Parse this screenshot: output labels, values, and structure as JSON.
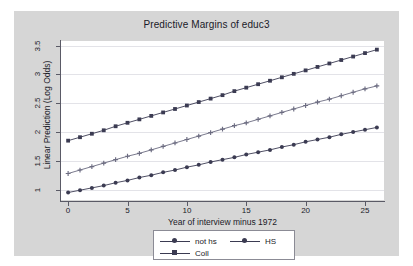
{
  "chart_data": {
    "type": "line",
    "title": "Predictive Margins of educ3",
    "xlabel": "Year of interview minus 1972",
    "ylabel": "Linear Prediction (Log Odds)",
    "xlim": [
      -0.6,
      26.6
    ],
    "ylim": [
      0.82,
      3.58
    ],
    "xticks": [
      0,
      5,
      10,
      15,
      20,
      25
    ],
    "yticks": [
      1,
      1.5,
      2,
      2.5,
      3,
      3.5
    ],
    "xtick_labels": [
      "0",
      "5",
      "10",
      "15",
      "20",
      "25"
    ],
    "ytick_labels": [
      "1",
      "1.5",
      "2",
      "2.5",
      "3",
      "3.5"
    ],
    "grid": "horizontal",
    "legend_position": "below",
    "x": [
      0,
      1,
      2,
      3,
      4,
      5,
      6,
      7,
      8,
      9,
      10,
      11,
      12,
      13,
      14,
      15,
      16,
      17,
      18,
      19,
      20,
      21,
      22,
      23,
      24,
      25,
      26
    ],
    "series": [
      {
        "name": "not hs",
        "marker": "circle",
        "color": "#3b3b52",
        "values": [
          0.95,
          0.99,
          1.03,
          1.07,
          1.12,
          1.16,
          1.21,
          1.25,
          1.3,
          1.34,
          1.39,
          1.43,
          1.48,
          1.52,
          1.56,
          1.61,
          1.65,
          1.69,
          1.74,
          1.78,
          1.83,
          1.87,
          1.91,
          1.96,
          2.0,
          2.04,
          2.08
        ]
      },
      {
        "name": "HS",
        "marker": "plus",
        "color": "#6b6b80",
        "values": [
          1.28,
          1.34,
          1.4,
          1.46,
          1.52,
          1.58,
          1.63,
          1.69,
          1.75,
          1.81,
          1.87,
          1.93,
          1.99,
          2.05,
          2.11,
          2.16,
          2.22,
          2.28,
          2.34,
          2.4,
          2.46,
          2.52,
          2.57,
          2.63,
          2.69,
          2.75,
          2.8
        ]
      },
      {
        "name": "Coll",
        "marker": "square",
        "color": "#3b3b52",
        "values": [
          1.85,
          1.91,
          1.97,
          2.03,
          2.1,
          2.16,
          2.22,
          2.28,
          2.34,
          2.4,
          2.46,
          2.52,
          2.58,
          2.64,
          2.71,
          2.77,
          2.83,
          2.89,
          2.95,
          3.01,
          3.07,
          3.13,
          3.19,
          3.25,
          3.31,
          3.37,
          3.43
        ]
      }
    ]
  },
  "colors": {
    "canvas": "#d6d6d6",
    "plot_background": "#ffffff",
    "gridline": "#e3e3e8",
    "axis": "#5a5a66",
    "text": "#1a1a28",
    "legend_border": "#8b8b95"
  },
  "legend": {
    "entries": [
      {
        "label": "not hs"
      },
      {
        "label": "HS"
      },
      {
        "label": "Coll"
      }
    ]
  }
}
